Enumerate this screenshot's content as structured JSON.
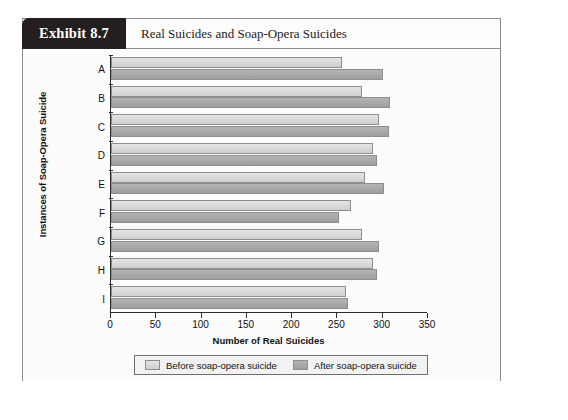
{
  "exhibit": {
    "tab_label": "Exhibit 8.7",
    "title": "Real Suicides and Soap-Opera Suicides"
  },
  "chart_data": {
    "type": "bar",
    "orientation": "horizontal",
    "title": "Real Suicides and Soap-Opera Suicides",
    "xlabel": "Number of Real Suicides",
    "ylabel": "Instances of Soap-Opera Suicide",
    "categories": [
      "A",
      "B",
      "C",
      "D",
      "E",
      "F",
      "G",
      "H",
      "I"
    ],
    "xlim": [
      0,
      350
    ],
    "xticks": [
      0,
      50,
      100,
      150,
      200,
      250,
      300,
      350
    ],
    "grid": false,
    "legend_position": "bottom",
    "series": [
      {
        "name": "Before soap-opera suicide",
        "color": "#d6d6d6",
        "values": [
          255,
          277,
          296,
          289,
          280,
          265,
          277,
          289,
          259
        ]
      },
      {
        "name": "After soap-opera suicide",
        "color": "#a8a8a8",
        "values": [
          300,
          308,
          307,
          294,
          301,
          252,
          296,
          294,
          262
        ]
      }
    ]
  },
  "legend": {
    "items": [
      {
        "label": "Before soap-opera suicide",
        "swatch": "before"
      },
      {
        "label": "After soap-opera suicide",
        "swatch": "after"
      }
    ]
  }
}
